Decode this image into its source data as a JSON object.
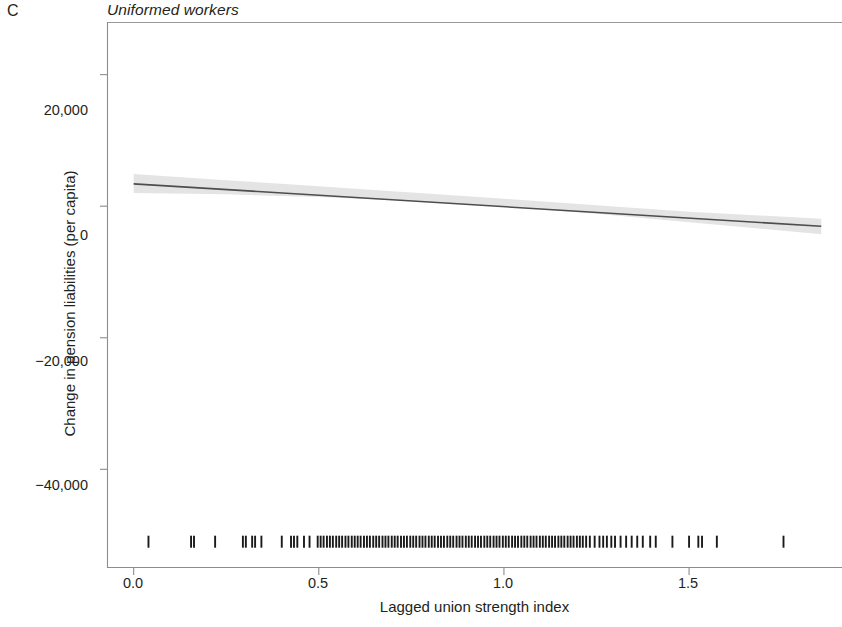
{
  "panel": {
    "letter": "C",
    "title": "Uniformed workers"
  },
  "axes": {
    "x_label": "Lagged union strength index",
    "y_label": "Change in pension liabilities (per capita)",
    "x_ticks": [
      "0.0",
      "0.5",
      "1.0",
      "1.5"
    ],
    "y_ticks": [
      "20,000",
      "0",
      "−20,000",
      "−40,000"
    ]
  },
  "colors": {
    "line": "#4d4d4d",
    "band": "#d9d9d9",
    "axis": "#8c8c8c",
    "rug": "#1a1a1a",
    "text": "#231f20"
  },
  "chart_data": {
    "type": "line",
    "title": "Uniformed workers",
    "subtitle": "C",
    "xlabel": "Lagged union strength index",
    "ylabel": "Change in pension liabilities (per capita)",
    "xlim": [
      -0.072,
      1.913
    ],
    "ylim": [
      -55000,
      28000
    ],
    "xticks": [
      0.0,
      0.5,
      1.0,
      1.5
    ],
    "xticklabels": [
      "0.0",
      "0.5",
      "1.0",
      "1.5"
    ],
    "yticks": [
      20000,
      0,
      -20000,
      -40000
    ],
    "yticklabels": [
      "20,000",
      "0",
      "−20,000",
      "−40,000"
    ],
    "grid": false,
    "legend": null,
    "series": [
      {
        "name": "Linear fit",
        "type": "line",
        "x": [
          0.0,
          1.857
        ],
        "y": [
          3400,
          -3050
        ],
        "slope": -3474,
        "intercept": 3400
      },
      {
        "name": "95% confidence band (upper)",
        "type": "band_upper",
        "x": [
          0.0,
          0.25,
          0.5,
          0.75,
          1.0,
          1.25,
          1.5,
          1.857
        ],
        "y": [
          4900,
          3950,
          3050,
          2100,
          1150,
          150,
          -850,
          -1900
        ]
      },
      {
        "name": "95% confidence band (lower)",
        "type": "band_lower",
        "x": [
          0.0,
          0.25,
          0.5,
          0.75,
          1.0,
          1.25,
          1.5,
          1.857
        ],
        "y": [
          2000,
          1800,
          1400,
          800,
          -50,
          -1150,
          -2450,
          -4250
        ]
      },
      {
        "name": "Rug (observed x values)",
        "type": "rug",
        "y_position": -51000,
        "x": [
          0.04,
          0.155,
          0.163,
          0.22,
          0.295,
          0.303,
          0.32,
          0.328,
          0.345,
          0.4,
          0.425,
          0.433,
          0.442,
          0.46,
          0.475,
          0.497,
          0.505,
          0.513,
          0.522,
          0.53,
          0.538,
          0.547,
          0.555,
          0.563,
          0.572,
          0.58,
          0.589,
          0.597,
          0.605,
          0.613,
          0.622,
          0.63,
          0.638,
          0.647,
          0.655,
          0.663,
          0.672,
          0.68,
          0.688,
          0.697,
          0.705,
          0.713,
          0.722,
          0.73,
          0.738,
          0.747,
          0.755,
          0.763,
          0.772,
          0.78,
          0.788,
          0.797,
          0.805,
          0.813,
          0.822,
          0.83,
          0.838,
          0.847,
          0.855,
          0.863,
          0.872,
          0.88,
          0.888,
          0.897,
          0.905,
          0.913,
          0.922,
          0.93,
          0.938,
          0.947,
          0.955,
          0.963,
          0.972,
          0.98,
          0.988,
          0.997,
          1.005,
          1.013,
          1.022,
          1.03,
          1.038,
          1.047,
          1.055,
          1.063,
          1.072,
          1.08,
          1.088,
          1.097,
          1.105,
          1.113,
          1.122,
          1.13,
          1.138,
          1.147,
          1.155,
          1.163,
          1.172,
          1.18,
          1.188,
          1.197,
          1.205,
          1.213,
          1.222,
          1.232,
          1.245,
          1.258,
          1.268,
          1.278,
          1.29,
          1.3,
          1.315,
          1.33,
          1.345,
          1.36,
          1.375,
          1.395,
          1.41,
          1.455,
          1.5,
          1.525,
          1.535,
          1.575,
          1.755
        ]
      }
    ]
  }
}
